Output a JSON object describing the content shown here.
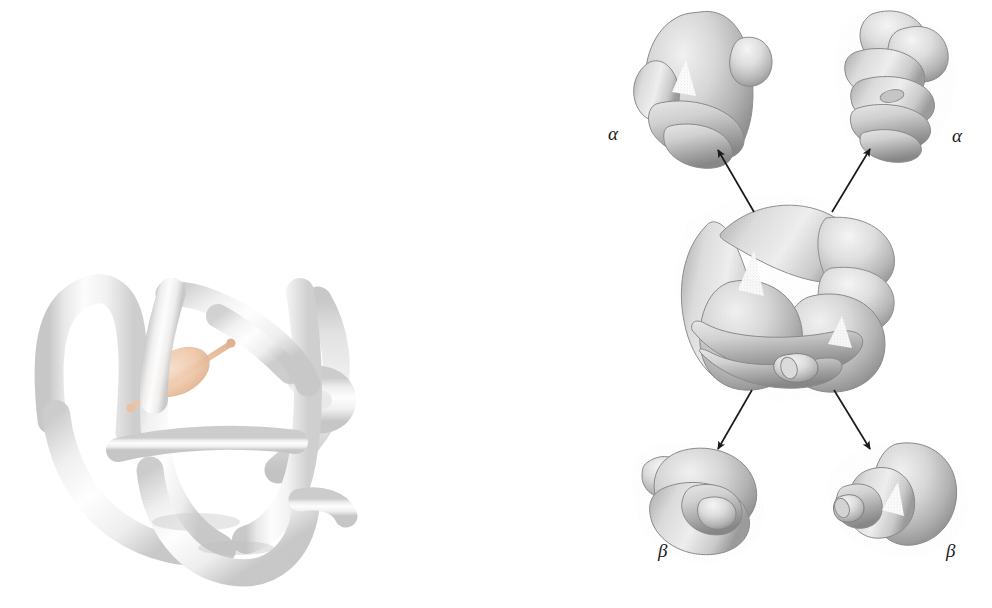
{
  "figure": {
    "background_color": "#ffffff",
    "panels": [
      {
        "id": "left-panel",
        "name": "myoglobin-ribbon-panel",
        "description": "single globin subunit tube model with heme group",
        "bbox": [
          20,
          265,
          355,
          590
        ]
      },
      {
        "id": "right-panel",
        "name": "hemoglobin-tetramer-dissociation-panel",
        "description": "hemoglobin tetramer in center with four arrows to dissociated subunits",
        "bbox": [
          600,
          0,
          992,
          580
        ]
      }
    ]
  },
  "colors": {
    "tube_light": "#f7f7f7",
    "tube_mid": "#e6e6e6",
    "tube_shadow": "#c9c9c9",
    "tube_deep_shadow": "#a8a8a8",
    "subunit_light": "#ededed",
    "subunit_mid": "#cfcfcf",
    "subunit_shadow": "#9a9a9a",
    "subunit_deep": "#7a7a7a",
    "heme_fill": "#f0c9ab",
    "heme_edge": "#e3b494",
    "heme_rod": "#e6bb9a",
    "arrow_color": "#1a1a1a",
    "label_color": "#1a1a1a"
  },
  "labels": [
    {
      "id": "alpha-top-left",
      "text": "α",
      "x": 608,
      "y": 133,
      "subunit": "alpha"
    },
    {
      "id": "alpha-top-right",
      "text": "α",
      "x": 952,
      "y": 135,
      "subunit": "alpha"
    },
    {
      "id": "beta-bottom-left",
      "text": "β",
      "x": 658,
      "y": 552,
      "subunit": "beta"
    },
    {
      "id": "beta-bottom-right",
      "text": "β",
      "x": 946,
      "y": 552,
      "subunit": "beta"
    }
  ],
  "arrows": [
    {
      "id": "arrow-to-alpha-top-left",
      "from": [
        754,
        212
      ],
      "to": [
        716,
        147
      ],
      "direction": "up-left"
    },
    {
      "id": "arrow-to-alpha-top-right",
      "from": [
        832,
        212
      ],
      "to": [
        872,
        146
      ],
      "direction": "up-right"
    },
    {
      "id": "arrow-to-beta-bottom-left",
      "from": [
        752,
        390
      ],
      "to": [
        716,
        452
      ],
      "direction": "down-left"
    },
    {
      "id": "arrow-to-beta-bottom-right",
      "from": [
        834,
        390
      ],
      "to": [
        872,
        452
      ],
      "direction": "down-right"
    }
  ],
  "subunits": [
    {
      "id": "tetramer-center",
      "label": "",
      "cx": 795,
      "cy": 300,
      "role": "assembled hemoglobin tetramer"
    },
    {
      "id": "subunit-alpha-1",
      "label": "α",
      "cx": 698,
      "cy": 82,
      "role": "dissociated alpha subunit"
    },
    {
      "id": "subunit-alpha-2",
      "label": "α",
      "cx": 898,
      "cy": 78,
      "role": "dissociated alpha subunit"
    },
    {
      "id": "subunit-beta-1",
      "label": "β",
      "cx": 700,
      "cy": 500,
      "role": "dissociated beta subunit"
    },
    {
      "id": "subunit-beta-2",
      "label": "β",
      "cx": 905,
      "cy": 497,
      "role": "dissociated beta subunit"
    }
  ],
  "heme": {
    "id": "heme-group",
    "cx": 178,
    "cy": 372,
    "rx": 34,
    "ry": 22,
    "rotation": -28,
    "rod_from": [
      130,
      408
    ],
    "rod_to": [
      232,
      343
    ]
  }
}
